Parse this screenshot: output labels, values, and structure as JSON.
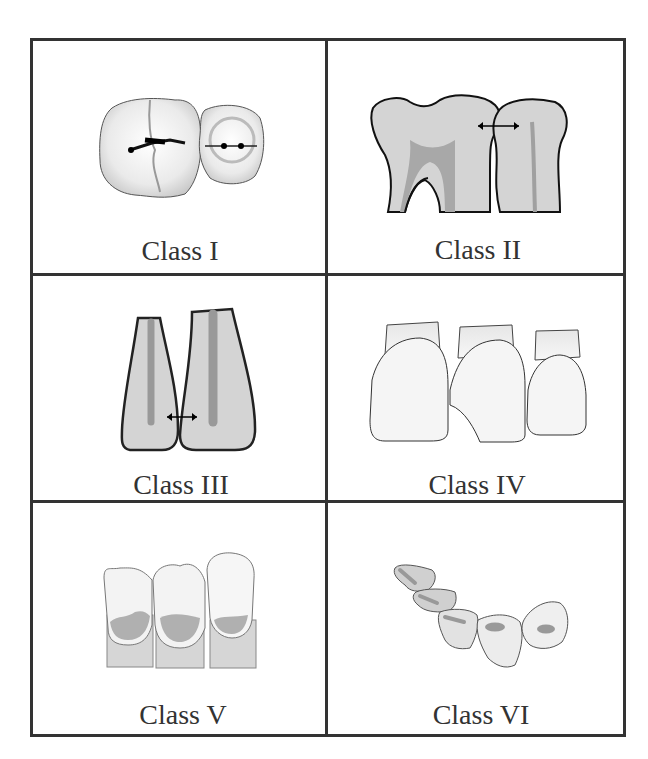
{
  "figure": {
    "cells": [
      {
        "id": "class-1",
        "label": "Class I",
        "description": "Occlusal pit and fissure caries on molar and premolar"
      },
      {
        "id": "class-2",
        "label": "Class II",
        "description": "Proximal surfaces of posterior teeth"
      },
      {
        "id": "class-3",
        "label": "Class III",
        "description": "Proximal surfaces of anterior teeth without incisal edge"
      },
      {
        "id": "class-4",
        "label": "Class IV",
        "description": "Proximal surfaces of anterior teeth including incisal edge"
      },
      {
        "id": "class-5",
        "label": "Class V",
        "description": "Cervical third of facial or lingual surfaces"
      },
      {
        "id": "class-6",
        "label": "Class VI",
        "description": "Incisal edges and cusp tips"
      }
    ],
    "colors": {
      "border": "#333333",
      "tooth_fill": "#d4d4d4",
      "pulp_fill": "#9a9a9a",
      "enamel_light": "#f2f2f2"
    }
  }
}
